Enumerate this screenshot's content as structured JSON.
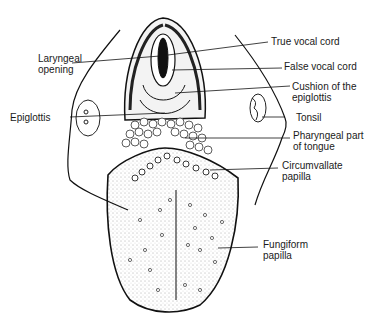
{
  "figure": {
    "labels_left": [
      {
        "id": "laryngeal-opening",
        "text": "Laryngeal\nopening"
      },
      {
        "id": "epiglottis",
        "text": "Epiglottis"
      }
    ],
    "labels_right": [
      {
        "id": "true-vocal-cord",
        "text": "True vocal cord"
      },
      {
        "id": "false-vocal-cord",
        "text": "False vocal cord"
      },
      {
        "id": "cushion-epiglottis",
        "text": "Cushion of the\nepiglottis"
      },
      {
        "id": "tonsil",
        "text": "Tonsil"
      },
      {
        "id": "pharyngeal-part",
        "text": "Pharyngeal part\nof tongue"
      },
      {
        "id": "circumvallate-papilla",
        "text": "Circumvallate\npapilla"
      },
      {
        "id": "fungiform-papilla",
        "text": "Fungiform\npapilla"
      }
    ]
  }
}
